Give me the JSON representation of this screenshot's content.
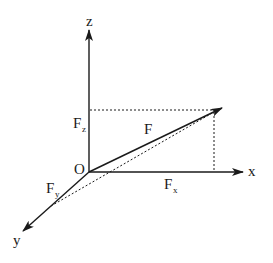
{
  "diagram": {
    "type": "3d-force-vector-components",
    "colors": {
      "line": "#1a1a1a",
      "background": "#ffffff"
    },
    "axes": {
      "x": {
        "label": "x"
      },
      "y": {
        "label": "y"
      },
      "z": {
        "label": "z"
      },
      "origin": {
        "label": "O"
      }
    },
    "vectors": {
      "F": {
        "label": "F",
        "base": "F",
        "sub": ""
      },
      "Fx": {
        "label": "Fx",
        "base": "F",
        "sub": "x"
      },
      "Fy": {
        "label": "Fy",
        "base": "F",
        "sub": "y"
      },
      "Fz": {
        "label": "Fz",
        "base": "F",
        "sub": "z"
      }
    }
  }
}
